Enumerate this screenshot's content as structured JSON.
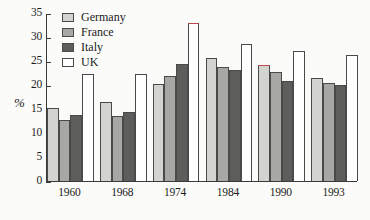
{
  "chart_data": {
    "type": "bar",
    "title": "",
    "xlabel": "",
    "ylabel": "%",
    "ylim": [
      0,
      35
    ],
    "yticks": [
      0,
      5,
      10,
      15,
      20,
      25,
      30,
      35
    ],
    "grid": false,
    "legend_position": "top-left",
    "categories": [
      "1960",
      "1968",
      "1974",
      "1984",
      "1990",
      "1993"
    ],
    "series": [
      {
        "name": "Germany",
        "color": "#d3d3cf",
        "values": [
          15.3,
          16.5,
          20.3,
          25.7,
          24.2,
          21.4
        ]
      },
      {
        "name": "France",
        "color": "#a7a7a3",
        "values": [
          12.7,
          13.5,
          21.8,
          23.7,
          22.7,
          20.4
        ]
      },
      {
        "name": "Italy",
        "color": "#5d5d5b",
        "values": [
          13.8,
          14.3,
          24.4,
          23.2,
          20.8,
          20.0
        ]
      },
      {
        "name": "UK",
        "color": "#ffffff",
        "values": [
          22.3,
          22.3,
          33.0,
          28.5,
          27.1,
          26.3
        ]
      }
    ],
    "annotations": [
      {
        "label": "red-top-mark",
        "category": "1974",
        "series": "UK",
        "color": "#c0474b"
      },
      {
        "label": "red-top-mark",
        "category": "1990",
        "series": "Germany",
        "color": "#c0474b"
      }
    ]
  },
  "legend": {
    "items": [
      {
        "label": "Germany"
      },
      {
        "label": "France"
      },
      {
        "label": "Italy"
      },
      {
        "label": "UK"
      }
    ]
  },
  "axes": {
    "y_label": "%",
    "y_ticks": [
      "0",
      "5",
      "10",
      "15",
      "20",
      "25",
      "30",
      "35"
    ],
    "x_ticks": [
      "1960",
      "1968",
      "1974",
      "1984",
      "1990",
      "1993"
    ]
  }
}
